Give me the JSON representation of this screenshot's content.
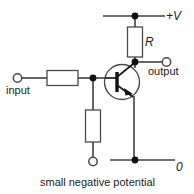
{
  "diagram": {
    "type": "schematic",
    "background_color": "#ffffff",
    "line_color": "#404040",
    "node_color": "#111111",
    "width": 194,
    "height": 194
  },
  "labels": {
    "supply": "+V",
    "resistor_r": "R",
    "output": "output",
    "input": "input",
    "ground": "0",
    "bias": "small negative potential"
  },
  "components": {
    "resistor_collector": {
      "name": "R",
      "orientation": "vertical",
      "label": "R"
    },
    "resistor_base_series": {
      "name": "base series resistor",
      "orientation": "horizontal",
      "label": ""
    },
    "resistor_base_pulldown": {
      "name": "base pull-down resistor",
      "orientation": "vertical",
      "label": ""
    },
    "transistor": {
      "name": "bipolar junction transistor",
      "envelope": "circle",
      "terminals": [
        "base",
        "collector",
        "emitter"
      ]
    }
  },
  "terminals": [
    {
      "name": "input-terminal",
      "label": "input"
    },
    {
      "name": "output-terminal",
      "label": "output"
    },
    {
      "name": "bias-terminal",
      "label": "small negative potential"
    }
  ],
  "nodes": [
    {
      "name": "supply-rail-node",
      "label": "+V"
    },
    {
      "name": "collector-node",
      "label": "output"
    },
    {
      "name": "base-node",
      "label": ""
    },
    {
      "name": "ground-rail-node",
      "label": "0"
    }
  ]
}
